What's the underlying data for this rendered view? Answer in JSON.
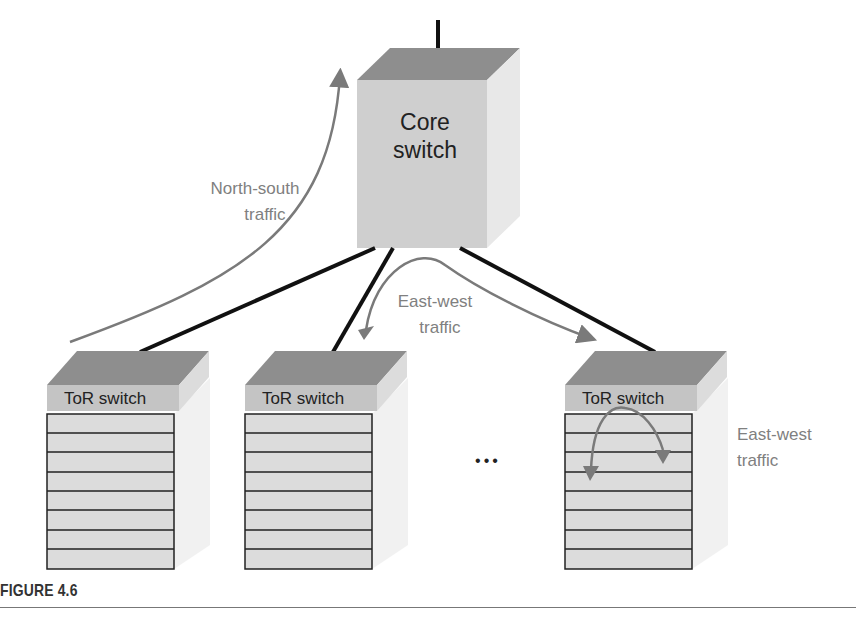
{
  "diagram": {
    "core_switch": {
      "line1": "Core",
      "line2": "switch"
    },
    "tor_switches": [
      {
        "label": "ToR switch",
        "server_rows": 8
      },
      {
        "label": "ToR switch",
        "server_rows": 8
      },
      {
        "label": "ToR switch",
        "server_rows": 8
      }
    ],
    "ellipsis": "•••",
    "annotations": {
      "north_south": {
        "line1": "North-south",
        "line2": "traffic"
      },
      "east_west_core": {
        "line1": "East-west",
        "line2": "traffic"
      },
      "east_west_rack": {
        "line1": "East-west",
        "line2": "traffic"
      }
    },
    "colors": {
      "box_face": "#cfcfcf",
      "box_top": "#8e8e8e",
      "box_side": "#e6e6e6",
      "arrow": "#7a7a7a",
      "link": "#111111",
      "label_gray": "#808080"
    }
  },
  "caption": "FIGURE 4.6"
}
